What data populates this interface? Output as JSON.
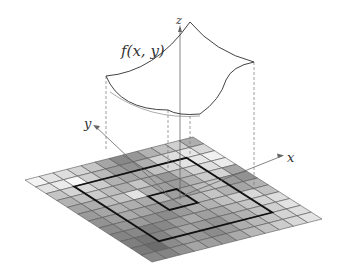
{
  "labels": {
    "function": "f(x, y)",
    "x_axis": "x",
    "y_axis": "y",
    "z_axis": "z"
  },
  "grid": {
    "rows": 12,
    "cols": 12,
    "note": "grayscale intensity per cell, 0=black 1=white, row 0 = far (top-left) edge, col 0 = left edge",
    "values": [
      [
        0.97,
        0.88,
        0.85,
        0.8,
        0.72,
        0.55,
        0.4,
        0.48,
        0.62,
        0.7,
        0.78,
        0.6
      ],
      [
        0.88,
        0.92,
        0.99,
        0.78,
        0.66,
        0.5,
        0.45,
        0.6,
        0.8,
        0.85,
        0.9,
        0.82
      ],
      [
        0.72,
        0.8,
        0.82,
        0.75,
        0.62,
        0.55,
        0.58,
        0.7,
        0.82,
        0.88,
        0.9,
        0.95
      ],
      [
        0.62,
        0.7,
        0.76,
        0.68,
        0.6,
        0.72,
        0.55,
        0.48,
        0.66,
        0.8,
        0.86,
        0.92
      ],
      [
        0.55,
        0.6,
        0.68,
        0.72,
        0.88,
        0.62,
        0.52,
        0.5,
        0.62,
        0.75,
        0.8,
        0.55
      ],
      [
        0.5,
        0.56,
        0.62,
        0.6,
        0.58,
        0.66,
        0.52,
        0.56,
        0.68,
        0.72,
        0.5,
        0.45
      ],
      [
        0.46,
        0.52,
        0.58,
        0.55,
        0.5,
        0.48,
        0.55,
        0.66,
        0.72,
        0.62,
        0.55,
        0.62
      ],
      [
        0.42,
        0.48,
        0.5,
        0.45,
        0.42,
        0.5,
        0.6,
        0.62,
        0.7,
        0.78,
        0.82,
        0.7
      ],
      [
        0.38,
        0.4,
        0.35,
        0.4,
        0.5,
        0.58,
        0.52,
        0.56,
        0.66,
        0.72,
        0.8,
        0.85
      ],
      [
        0.35,
        0.3,
        0.38,
        0.48,
        0.55,
        0.5,
        0.45,
        0.55,
        0.62,
        0.7,
        0.78,
        0.88
      ],
      [
        0.32,
        0.25,
        0.42,
        0.52,
        0.48,
        0.42,
        0.5,
        0.6,
        0.66,
        0.72,
        0.8,
        0.85
      ],
      [
        0.4,
        0.38,
        0.45,
        0.55,
        0.52,
        0.48,
        0.58,
        0.65,
        0.7,
        0.76,
        0.82,
        0.88
      ]
    ],
    "outer_box": {
      "row_start": 2,
      "row_end": 10,
      "col_start": 2,
      "col_end": 10
    },
    "inner_box": {
      "row_start": 5,
      "row_end": 7,
      "col_start": 5,
      "col_end": 7
    }
  },
  "colors": {
    "grid_line": "#555555",
    "box_line": "#111111",
    "surface_line": "#444444",
    "axis_line": "#666666",
    "dash_line": "#777777"
  }
}
